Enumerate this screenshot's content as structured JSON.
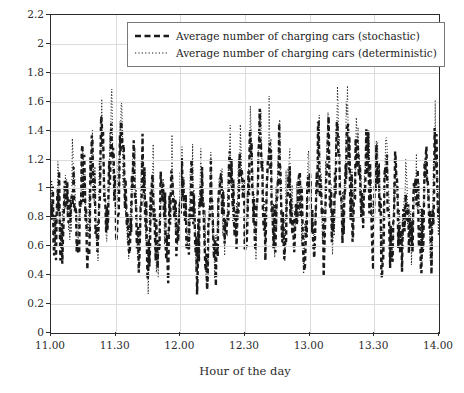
{
  "chart_data": {
    "type": "line",
    "title": "",
    "xlabel": "Hour of the day",
    "ylabel": "",
    "grid": true,
    "legend_position": "top-center-inside",
    "xlim": [
      11.0,
      14.0
    ],
    "ylim": [
      0,
      2.2
    ],
    "x_tick_labels": [
      "11.00",
      "11.30",
      "12.00",
      "12.30",
      "13.00",
      "13.30",
      "14.00"
    ],
    "x_tick_values": [
      11.0,
      11.5,
      12.0,
      12.5,
      13.0,
      13.5,
      14.0
    ],
    "y_tick_labels": [
      "0",
      "0.2",
      "0.4",
      "0.6",
      "0.8",
      "1",
      "1.2",
      "1.4",
      "1.6",
      "1.8",
      "2",
      "2.2"
    ],
    "y_tick_values": [
      0,
      0.2,
      0.4,
      0.6,
      0.8,
      1.0,
      1.2,
      1.4,
      1.6,
      1.8,
      2.0,
      2.2
    ],
    "series": [
      {
        "name": "Average number of charging cars (stochastic)",
        "style": "thick-dashed",
        "color": "#1a1a1a",
        "values": [
          0.72,
          0.82,
          0.62,
          0.88,
          0.95,
          0.58,
          0.74,
          1.02,
          0.86,
          0.66,
          0.8,
          1.1,
          0.92,
          0.7,
          0.52,
          0.84,
          1.18,
          0.96,
          0.74,
          0.6,
          0.9,
          1.28,
          1.02,
          0.8,
          0.64,
          0.96,
          1.38,
          1.12,
          0.86,
          0.68,
          1.0,
          1.46,
          1.18,
          0.9,
          0.72,
          1.06,
          1.52,
          1.22,
          0.94,
          0.76,
          0.54,
          0.86,
          1.2,
          0.98,
          0.76,
          0.58,
          0.88,
          1.14,
          0.92,
          0.7,
          0.46,
          0.78,
          1.06,
          0.88,
          0.66,
          0.5,
          0.82,
          1.08,
          0.9,
          0.68,
          0.48,
          0.8,
          1.12,
          0.94,
          0.72,
          0.56,
          0.88,
          1.16,
          0.96,
          0.74,
          0.52,
          0.84,
          1.1,
          0.9,
          0.68,
          0.44,
          0.76,
          1.02,
          0.86,
          0.64,
          0.3,
          0.66,
          0.98,
          0.82,
          0.62,
          0.46,
          0.8,
          1.12,
          0.92,
          0.7,
          0.56,
          0.9,
          1.24,
          1.0,
          0.78,
          0.6,
          0.92,
          1.26,
          1.04,
          0.82,
          0.62,
          0.94,
          1.34,
          1.08,
          0.84,
          0.66,
          0.98,
          1.4,
          1.14,
          0.88,
          0.7,
          1.02,
          1.3,
          1.06,
          0.82,
          0.64,
          0.96,
          1.22,
          1.0,
          0.78,
          0.58,
          0.9,
          1.16,
          0.94,
          0.72,
          0.54,
          0.86,
          1.08,
          0.88,
          0.66,
          0.5,
          0.84,
          1.18,
          0.96,
          0.74,
          0.6,
          0.92,
          1.28,
          1.02,
          0.8,
          0.64,
          0.96,
          1.36,
          1.1,
          0.86,
          0.68,
          1.0,
          1.44,
          1.16,
          0.9,
          0.72,
          1.04,
          1.5,
          1.2,
          0.92,
          0.74,
          1.06,
          1.42,
          1.14,
          0.88,
          0.68,
          1.0,
          1.32,
          1.06,
          0.82,
          0.62,
          0.94,
          1.2,
          0.98,
          0.76,
          0.56,
          0.88,
          1.14,
          0.92,
          0.7,
          0.52,
          0.84,
          1.1,
          0.9,
          0.68,
          0.48,
          0.8,
          1.06,
          0.88,
          0.66,
          0.5,
          0.82,
          1.12,
          0.94,
          0.72,
          0.54,
          0.86,
          1.2,
          0.98,
          0.76,
          0.58,
          0.9,
          1.26,
          1.02,
          0.8
        ],
        "approx_min": 0.3,
        "approx_max": 1.56
      },
      {
        "name": "Average number of charging cars (deterministic)",
        "style": "dotted",
        "color": "#1a1a1a",
        "values": [
          0.76,
          0.88,
          0.66,
          0.94,
          1.02,
          0.62,
          0.8,
          1.1,
          0.92,
          0.7,
          0.86,
          1.18,
          0.98,
          0.74,
          0.56,
          0.9,
          1.26,
          1.02,
          0.78,
          0.64,
          0.96,
          1.38,
          1.1,
          0.86,
          0.68,
          1.02,
          1.48,
          1.2,
          0.92,
          0.72,
          1.08,
          1.58,
          1.26,
          0.96,
          0.76,
          1.14,
          1.64,
          1.3,
          1.0,
          0.8,
          0.58,
          0.92,
          1.28,
          1.04,
          0.8,
          0.62,
          0.94,
          1.22,
          0.98,
          0.74,
          0.5,
          0.84,
          1.12,
          0.94,
          0.7,
          0.54,
          0.88,
          1.16,
          0.96,
          0.72,
          0.52,
          0.86,
          1.2,
          1.0,
          0.76,
          0.6,
          0.94,
          1.24,
          1.02,
          0.78,
          0.56,
          0.9,
          1.18,
          0.96,
          0.72,
          0.48,
          0.82,
          1.1,
          0.92,
          0.68,
          0.34,
          0.72,
          1.06,
          0.88,
          0.66,
          0.5,
          0.86,
          1.2,
          0.98,
          0.74,
          0.6,
          0.96,
          1.32,
          1.06,
          0.82,
          0.64,
          0.98,
          1.36,
          1.1,
          0.88,
          0.66,
          1.0,
          1.42,
          1.16,
          0.9,
          0.7,
          1.06,
          1.5,
          1.22,
          0.94,
          0.74,
          1.1,
          1.4,
          1.14,
          0.88,
          0.68,
          1.02,
          1.3,
          1.06,
          0.82,
          0.62,
          0.96,
          1.24,
          1.0,
          0.76,
          0.58,
          0.92,
          1.16,
          0.94,
          0.7,
          0.54,
          0.9,
          1.26,
          1.02,
          0.78,
          0.64,
          0.98,
          1.36,
          1.08,
          0.86,
          0.68,
          1.02,
          1.46,
          1.18,
          0.92,
          0.72,
          1.08,
          1.56,
          1.24,
          0.96,
          0.78,
          1.12,
          1.68,
          1.3,
          0.98,
          0.8,
          1.14,
          1.52,
          1.22,
          0.94,
          0.72,
          1.06,
          1.42,
          1.14,
          0.88,
          0.66,
          1.0,
          1.28,
          1.04,
          0.8,
          0.6,
          0.94,
          1.22,
          0.98,
          0.74,
          0.56,
          0.9,
          1.18,
          0.96,
          0.72,
          0.52,
          0.86,
          1.14,
          0.94,
          0.7,
          0.54,
          0.88,
          1.2,
          1.0,
          0.76,
          0.58,
          0.92,
          1.3,
          1.04,
          0.8,
          0.62,
          0.96,
          1.34,
          1.08,
          0.84
        ],
        "approx_min": 0.34,
        "approx_max": 1.7
      }
    ]
  }
}
